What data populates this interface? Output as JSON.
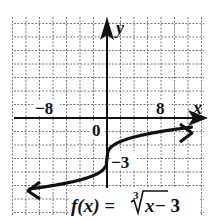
{
  "chart_data": {
    "type": "line",
    "function": "cbrt(x) - 3",
    "xlabel": "x",
    "ylabel": "y",
    "x_tick_labels": [
      "-8",
      "0",
      "8"
    ],
    "y_tick_labels": [
      "-3"
    ],
    "xlim": [
      -14,
      14
    ],
    "ylim": [
      -7,
      7
    ],
    "x_grid_step": 2,
    "y_grid_step": 1,
    "grid": true,
    "points": [
      {
        "x": -13,
        "y": -5.35
      },
      {
        "x": -8,
        "y": -5
      },
      {
        "x": -1,
        "y": -4
      },
      {
        "x": 0,
        "y": -3
      },
      {
        "x": 1,
        "y": -2
      },
      {
        "x": 8,
        "y": -1
      },
      {
        "x": 12,
        "y": -0.71
      }
    ]
  },
  "labels": {
    "x_axis": "x",
    "y_axis": "y",
    "origin": "0",
    "neg8": "−8",
    "pos8": "8",
    "neg3": "−3",
    "func_prefix": "f(x) = ",
    "radical_index": "3",
    "func_radicand": "x",
    "func_suffix": " − 3"
  }
}
